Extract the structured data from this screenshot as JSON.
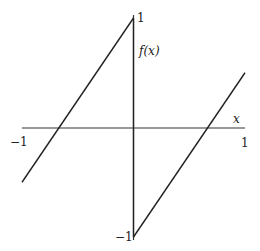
{
  "chart_data": {
    "type": "line",
    "title": "",
    "xlabel": "x",
    "ylabel": "f(x)",
    "xlim": [
      -1,
      1
    ],
    "ylim": [
      -1,
      1
    ],
    "grid": false,
    "legend": null,
    "x_tick_labels": [
      "−1",
      "1"
    ],
    "y_tick_labels": [
      "1",
      "−1"
    ],
    "series": [
      {
        "name": "f(x) for x<0",
        "x": [
          -1,
          0
        ],
        "y": [
          -0.5,
          1
        ]
      },
      {
        "name": "f(x) for x>0",
        "x": [
          0,
          1
        ],
        "y": [
          -1,
          0.5
        ]
      },
      {
        "name": "discontinuity jump at x=0",
        "x": [
          0,
          0
        ],
        "y": [
          1,
          -1
        ]
      }
    ],
    "annotations": [
      "1",
      "f(x)",
      "x",
      "−1",
      "1",
      "−1"
    ]
  },
  "labels": {
    "y_top": "1",
    "y_name": "f(x)",
    "x_name": "x",
    "x_left": "−1",
    "x_right": "1",
    "y_bottom": "−1"
  },
  "colors": {
    "line": "#222222",
    "axis": "#333333"
  }
}
